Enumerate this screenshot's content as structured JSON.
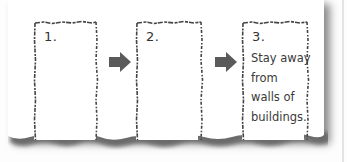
{
  "diagram": {
    "type": "sequence",
    "steps": [
      {
        "number": "1.",
        "text": ""
      },
      {
        "number": "2.",
        "text": ""
      },
      {
        "number": "3.",
        "text": "Stay away\nfrom\nwalls of\nbuildings."
      }
    ],
    "arrows": [
      {
        "from": 1,
        "to": 2,
        "icon": "arrow-right-icon"
      },
      {
        "from": 2,
        "to": 3,
        "icon": "arrow-right-icon"
      }
    ]
  },
  "colors": {
    "arrow": "#5a5a5a",
    "border": "#444444",
    "text": "#3a3a3a",
    "paper": "#ffffff"
  }
}
